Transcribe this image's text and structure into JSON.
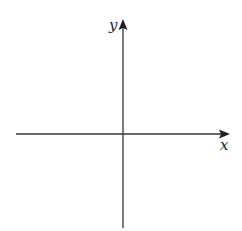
{
  "diagram": {
    "type": "cartesian-axes",
    "x_axis": {
      "label": "x"
    },
    "y_axis": {
      "label": "y"
    },
    "colors": {
      "axis": "#333333",
      "background": "#ffffff"
    }
  }
}
